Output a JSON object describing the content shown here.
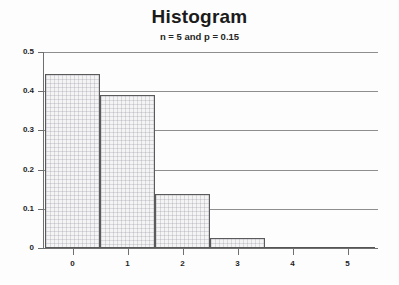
{
  "chart_data": {
    "type": "bar",
    "title": "Histogram",
    "subtitle": "n = 5 and p = 0.15",
    "xlabel": "",
    "ylabel": "",
    "categories": [
      "0",
      "1",
      "2",
      "3",
      "4",
      "5"
    ],
    "values": [
      0.4437,
      0.3915,
      0.1382,
      0.0244,
      0.0022,
      0.0001
    ],
    "ylim": [
      0,
      0.5
    ],
    "xlim": [
      -0.5,
      5.5
    ],
    "y_ticks": [
      "0",
      "0.1",
      "0.2",
      "0.3",
      "0.4",
      "0.5"
    ],
    "y_tick_values": [
      0,
      0.1,
      0.2,
      0.3,
      0.4,
      0.5
    ],
    "x_ticks": [
      "0",
      "1",
      "2",
      "3",
      "4",
      "5"
    ],
    "grid": "horizontal",
    "legend": "none",
    "bar_fill": "#f4f4f4",
    "bar_edge": "#5a5a5a",
    "axis_color": "#6f6f6f",
    "grid_color": "#8e8e8e"
  }
}
